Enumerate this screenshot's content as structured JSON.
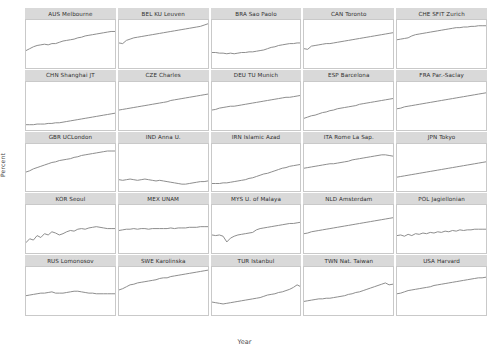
{
  "chart_data": {
    "type": "line",
    "title": "",
    "xlabel": "Year",
    "ylabel": "Percent",
    "ylim": [
      0,
      75
    ],
    "xlim": [
      1996,
      2020
    ],
    "yticks": [
      20,
      40,
      60
    ],
    "ytick_labels": [
      "20",
      "40",
      "60"
    ],
    "xticks": [
      2000,
      2020
    ],
    "xtick_labels": [
      "00",
      "20"
    ],
    "grid": false,
    "legend": "none",
    "layout": {
      "rows": 5,
      "cols": 5,
      "strip_position": "top"
    },
    "line_color": "#8e8e8e",
    "strip_color": "#d9d9d9",
    "panel_border_color": "#c9c9c9",
    "background": "#ffffff",
    "x": [
      1996,
      1997,
      1998,
      1999,
      2000,
      2001,
      2002,
      2003,
      2004,
      2005,
      2006,
      2007,
      2008,
      2009,
      2010,
      2011,
      2012,
      2013,
      2014,
      2015,
      2016,
      2017,
      2018,
      2019,
      2020
    ],
    "panels": [
      {
        "label": "AUS Melbourne",
        "values": [
          27,
          30,
          33,
          35,
          36,
          37,
          36,
          38,
          38,
          40,
          42,
          43,
          44,
          45,
          47,
          48,
          50,
          51,
          52,
          53,
          54,
          55,
          56,
          57,
          57
        ]
      },
      {
        "label": "BEL KU Leuven",
        "values": [
          39,
          38,
          43,
          45,
          47,
          48,
          49,
          50,
          51,
          52,
          53,
          54,
          55,
          56,
          57,
          58,
          59,
          60,
          61,
          62,
          63,
          64,
          65,
          67,
          69
        ]
      },
      {
        "label": "BRA Sao Paolo",
        "values": [
          24,
          24,
          23,
          23,
          22,
          23,
          22,
          23,
          24,
          24,
          25,
          25,
          26,
          27,
          28,
          30,
          32,
          33,
          35,
          36,
          37,
          38,
          38,
          39,
          39
        ]
      },
      {
        "label": "CAN Toronto",
        "values": [
          30,
          29,
          34,
          35,
          36,
          37,
          38,
          38,
          39,
          40,
          41,
          42,
          43,
          44,
          45,
          46,
          47,
          48,
          49,
          50,
          51,
          52,
          53,
          54,
          55
        ]
      },
      {
        "label": "CHE SFIT Zurich",
        "values": [
          44,
          45,
          46,
          47,
          50,
          52,
          53,
          54,
          55,
          56,
          57,
          58,
          59,
          60,
          61,
          62,
          63,
          63,
          64,
          64,
          65,
          65,
          66,
          66,
          66
        ]
      },
      {
        "label": "CHN Shanghai JT",
        "values": [
          8,
          8,
          8,
          9,
          9,
          9,
          10,
          10,
          11,
          11,
          12,
          13,
          14,
          15,
          16,
          17,
          18,
          19,
          20,
          21,
          22,
          23,
          24,
          25,
          26
        ]
      },
      {
        "label": "CZE Charles",
        "values": [
          31,
          32,
          33,
          34,
          35,
          36,
          37,
          38,
          39,
          40,
          41,
          42,
          43,
          44,
          46,
          47,
          48,
          49,
          50,
          51,
          52,
          53,
          54,
          55,
          56
        ]
      },
      {
        "label": "DEU TU Munich",
        "values": [
          31,
          32,
          34,
          35,
          36,
          37,
          37,
          38,
          39,
          40,
          41,
          42,
          43,
          44,
          45,
          46,
          47,
          48,
          49,
          50,
          51,
          51,
          52,
          53,
          54
        ]
      },
      {
        "label": "ESP Barcelona",
        "values": [
          18,
          20,
          22,
          23,
          25,
          27,
          28,
          30,
          31,
          33,
          34,
          35,
          36,
          37,
          38,
          40,
          41,
          42,
          43,
          44,
          45,
          46,
          47,
          48,
          49
        ]
      },
      {
        "label": "FRA Par.-Saclay",
        "values": [
          33,
          34,
          36,
          37,
          38,
          39,
          40,
          41,
          42,
          43,
          44,
          45,
          46,
          47,
          48,
          49,
          50,
          51,
          52,
          53,
          54,
          55,
          56,
          57,
          58
        ]
      },
      {
        "label": "GBR UCLondon",
        "values": [
          31,
          33,
          36,
          38,
          40,
          42,
          44,
          46,
          47,
          49,
          50,
          51,
          52,
          54,
          55,
          57,
          58,
          59,
          60,
          61,
          62,
          63,
          64,
          64,
          64
        ]
      },
      {
        "label": "IND Anna U.",
        "values": [
          19,
          18,
          19,
          20,
          19,
          18,
          19,
          20,
          19,
          18,
          17,
          18,
          17,
          16,
          15,
          14,
          13,
          12,
          12,
          13,
          14,
          15,
          16,
          16,
          17
        ]
      },
      {
        "label": "IRN Islamic Azad",
        "values": [
          13,
          13,
          13,
          14,
          14,
          15,
          16,
          17,
          18,
          19,
          21,
          22,
          24,
          26,
          28,
          29,
          31,
          33,
          35,
          37,
          38,
          40,
          41,
          42,
          43
        ]
      },
      {
        "label": "ITA Rome La Sap.",
        "values": [
          37,
          38,
          39,
          40,
          41,
          42,
          43,
          44,
          44,
          45,
          46,
          47,
          48,
          50,
          51,
          52,
          53,
          54,
          55,
          56,
          57,
          58,
          58,
          57,
          56
        ]
      },
      {
        "label": "JPN Tokyo",
        "values": [
          23,
          24,
          25,
          26,
          27,
          28,
          29,
          30,
          31,
          32,
          33,
          34,
          35,
          36,
          37,
          38,
          39,
          40,
          41,
          42,
          43,
          44,
          45,
          46,
          47
        ]
      },
      {
        "label": "KOR Seoul",
        "values": [
          16,
          22,
          20,
          27,
          24,
          30,
          28,
          33,
          31,
          28,
          30,
          33,
          35,
          34,
          37,
          38,
          37,
          39,
          40,
          41,
          40,
          39,
          38,
          38,
          38
        ]
      },
      {
        "label": "MEX UNAM",
        "values": [
          35,
          36,
          37,
          37,
          38,
          37,
          38,
          38,
          37,
          38,
          38,
          38,
          38,
          38,
          39,
          38,
          39,
          39,
          39,
          40,
          40,
          40,
          41,
          41,
          41
        ]
      },
      {
        "label": "MYS U. of Malaya",
        "values": [
          28,
          27,
          28,
          26,
          17,
          23,
          26,
          28,
          29,
          30,
          31,
          32,
          36,
          38,
          39,
          40,
          41,
          42,
          43,
          44,
          45,
          46,
          46,
          47,
          48
        ]
      },
      {
        "label": "NLD Amsterdam",
        "values": [
          30,
          31,
          33,
          34,
          35,
          36,
          37,
          38,
          39,
          40,
          41,
          42,
          43,
          44,
          45,
          46,
          47,
          48,
          49,
          50,
          51,
          52,
          53,
          54,
          55
        ]
      },
      {
        "label": "POL Jagiellonian",
        "values": [
          27,
          28,
          26,
          29,
          27,
          30,
          29,
          31,
          30,
          32,
          31,
          33,
          32,
          34,
          33,
          35,
          34,
          36,
          35,
          36,
          36,
          37,
          37,
          37,
          37
        ]
      },
      {
        "label": "RUS Lomonosov",
        "values": [
          30,
          31,
          32,
          33,
          34,
          34,
          35,
          36,
          34,
          34,
          34,
          35,
          36,
          37,
          37,
          36,
          35,
          34,
          34,
          33,
          33,
          33,
          33,
          33,
          33
        ]
      },
      {
        "label": "SWE Karolinska",
        "values": [
          39,
          41,
          44,
          47,
          48,
          50,
          51,
          52,
          53,
          54,
          55,
          57,
          58,
          58,
          60,
          61,
          62,
          63,
          64,
          65,
          66,
          67,
          68,
          69,
          70
        ]
      },
      {
        "label": "TUR Istanbul",
        "values": [
          20,
          19,
          18,
          17,
          18,
          19,
          20,
          21,
          22,
          23,
          24,
          25,
          26,
          27,
          29,
          31,
          32,
          33,
          35,
          36,
          38,
          40,
          43,
          47,
          44
        ]
      },
      {
        "label": "TWN Nat. Taiwan",
        "values": [
          21,
          22,
          23,
          24,
          25,
          25,
          26,
          26,
          27,
          28,
          29,
          30,
          32,
          33,
          35,
          36,
          38,
          40,
          42,
          44,
          46,
          48,
          50,
          47,
          48
        ]
      },
      {
        "label": "USA Harvard",
        "values": [
          33,
          34,
          36,
          38,
          39,
          40,
          41,
          42,
          43,
          44,
          46,
          47,
          48,
          49,
          50,
          51,
          52,
          53,
          54,
          55,
          56,
          57,
          58,
          58,
          59
        ]
      }
    ]
  }
}
